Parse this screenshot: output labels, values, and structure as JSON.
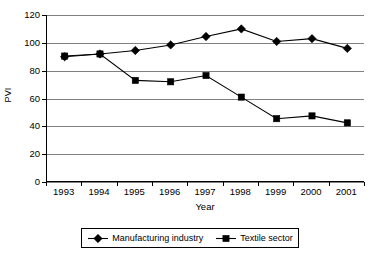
{
  "chart_data": {
    "type": "line",
    "title": "",
    "xlabel": "Year",
    "ylabel": "PVI",
    "categories": [
      "1993",
      "1994",
      "1995",
      "1996",
      "1997",
      "1998",
      "1999",
      "2000",
      "2001"
    ],
    "series": [
      {
        "name": "Manufacturing industry",
        "marker": "diamond",
        "color": "#000000",
        "values": [
          90,
          92,
          94.5,
          98.5,
          104.5,
          110,
          101,
          103,
          96
        ]
      },
      {
        "name": "Textile sector",
        "marker": "square",
        "color": "#000000",
        "values": [
          90.5,
          92,
          73,
          72,
          76.5,
          61,
          45.5,
          47.5,
          42.5
        ]
      }
    ],
    "ylim": [
      0,
      120
    ],
    "yticks": [
      0,
      20,
      40,
      60,
      80,
      100,
      120
    ],
    "ytick_labels": [
      "0",
      "20",
      "40",
      "60",
      "80",
      "100",
      "120"
    ],
    "grid": "horizontal",
    "legend_position": "bottom"
  },
  "legend": {
    "entries": [
      {
        "label": "Manufacturing industry"
      },
      {
        "label": "Textile sector"
      }
    ]
  }
}
